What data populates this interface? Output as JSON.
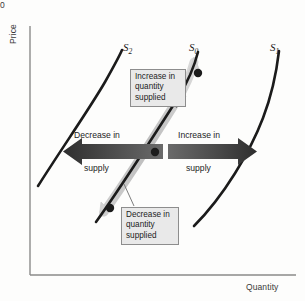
{
  "figure": {
    "type": "economics-supply-shift-diagram",
    "axes": {
      "y_label": "Price",
      "x_label": "Quantity",
      "origin_label": "0",
      "y_axis_x": 30,
      "x_axis_y": 275
    },
    "curves": [
      {
        "id": "s2",
        "label_base": "S",
        "label_sub": "2",
        "color": "#1b1b1b",
        "description": "leftmost supply curve after decrease in supply",
        "path": "M 38,186 C 60,150 88,110 104,82 C 114,64 119,56 122,50"
      },
      {
        "id": "s0",
        "label_base": "S",
        "label_sub": "0",
        "color": "#1b1b1b",
        "description": "original supply curve",
        "path": "M 96,222 C 120,188 155,130 178,98 C 190,80 195,66 198,52"
      },
      {
        "id": "s1",
        "label_base": "S",
        "label_sub": "1",
        "color": "#1b1b1b",
        "description": "rightmost supply curve after increase in supply",
        "path": "M 194,224 C 222,196 248,152 262,118 C 272,92 277,68 279,51"
      }
    ],
    "movement_arrow": {
      "name": "quantity-supplied-movement-arrow",
      "color_light": "#d8d8d8",
      "color_dark": "#a8a8a8",
      "description": "double-headed shaded arrow running along curve S0 showing movement along the curve"
    },
    "points": [
      {
        "name": "upper-point",
        "x": 198,
        "y": 73
      },
      {
        "name": "middle-point",
        "x": 155,
        "y": 152
      },
      {
        "name": "lower-point",
        "x": 110,
        "y": 208
      }
    ],
    "curve_labels": {
      "s2": "S",
      "s2_sub": "2",
      "s0": "S",
      "s0_sub": "0",
      "s1": "S",
      "s1_sub": "1"
    },
    "callouts": [
      {
        "name": "increase-in-quantity-supplied-callout",
        "lines": [
          "Increase in",
          "quantity",
          "supplied"
        ],
        "text": "Increase in quantity supplied"
      },
      {
        "name": "decrease-in-quantity-supplied-callout",
        "lines": [
          "Decrease in",
          "quantity",
          "supplied"
        ],
        "text": "Decrease in quantity supplied"
      }
    ],
    "shift_arrows": [
      {
        "name": "decrease-in-supply-arrow",
        "direction": "left",
        "line1": "Decrease in",
        "line2": "supply",
        "color": "#4a4a4a"
      },
      {
        "name": "increase-in-supply-arrow",
        "direction": "right",
        "line1": "Increase in",
        "line2": "supply",
        "color": "#4a4a4a"
      }
    ],
    "colors": {
      "curve": "#1b1b1b",
      "axis": "#8a8a8a",
      "callout_fill": "#e9e9e9",
      "callout_border": "#8d8d8d",
      "shift_arrow": "#4a4a4a",
      "movement_arrow": "#d2d2d2",
      "point": "#1b1b1b",
      "background": "#fdfdfc"
    }
  }
}
